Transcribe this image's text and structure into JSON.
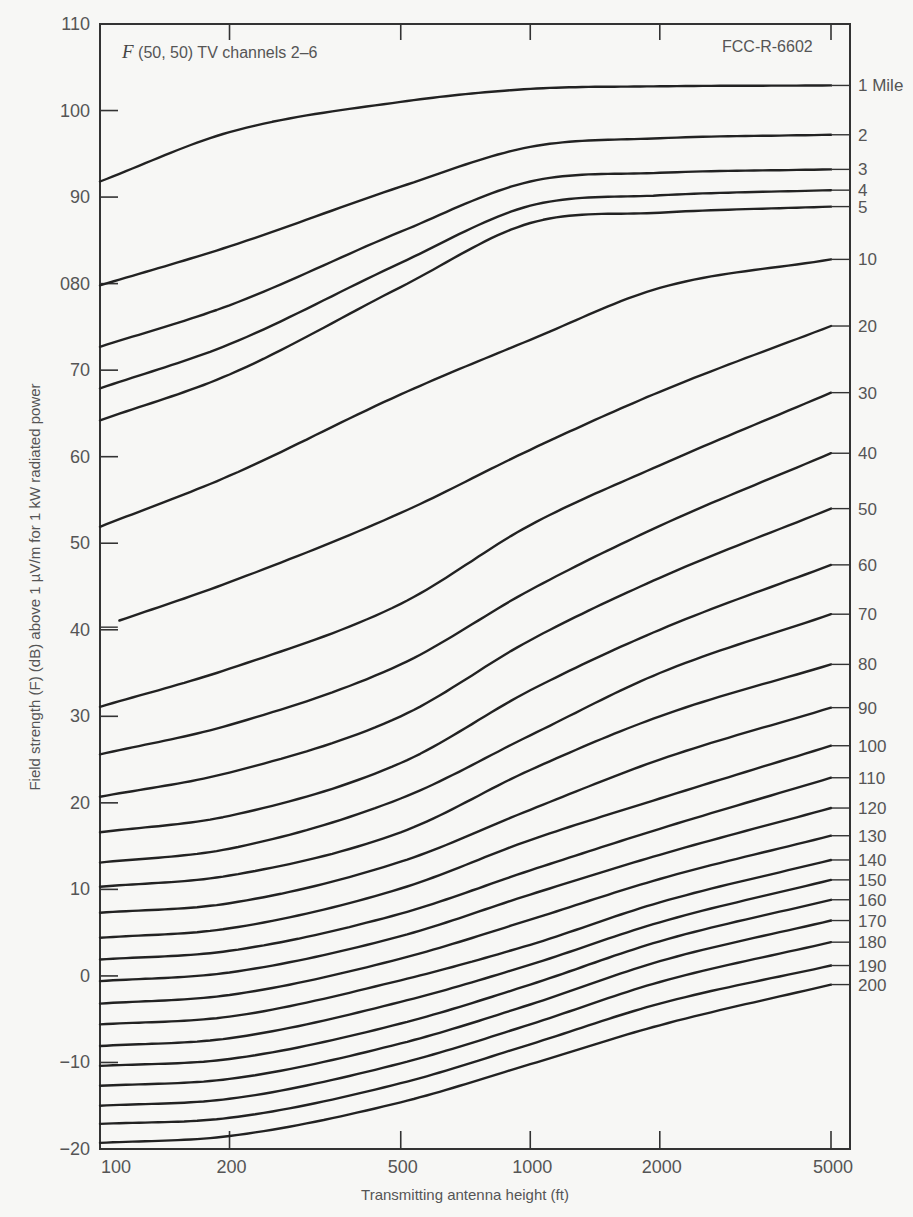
{
  "chart_data": {
    "type": "line",
    "title": "F (50, 50) TV channels 2–6",
    "title_prefix": "F",
    "title_rest": " (50, 50) TV channels 2–6",
    "reference": "FCC-R-6602",
    "xlabel": "Transmitting antenna height (ft)",
    "ylabel": "Field strength (F) (dB) above 1 µV/m for 1 kW radiated power",
    "xscale": "log",
    "xlim": [
      100,
      5000
    ],
    "ylim": [
      -20,
      110
    ],
    "grid": false,
    "x_ticks": [
      100,
      200,
      500,
      1000,
      2000,
      5000
    ],
    "x_tick_labels": [
      "100",
      "200",
      "500",
      "1000",
      "2000",
      "5000"
    ],
    "y_ticks": [
      110,
      100,
      90,
      80,
      70,
      60,
      50,
      40,
      30,
      20,
      10,
      0,
      -10,
      -20
    ],
    "y_tick_labels": [
      "110",
      "100",
      "90",
      "080",
      "70",
      "60",
      "50",
      "40",
      "30",
      "20",
      "10",
      "0",
      "−10",
      "−20"
    ],
    "series_label_position": "right",
    "x": [
      100,
      200,
      500,
      1000,
      2000,
      5000
    ],
    "series": [
      {
        "name": "1 Mile",
        "values": [
          91.8,
          97.5,
          101.0,
          102.5,
          102.8,
          102.9
        ]
      },
      {
        "name": "2",
        "values": [
          79.8,
          84.3,
          91.2,
          95.8,
          96.8,
          97.2
        ]
      },
      {
        "name": "3",
        "values": [
          72.7,
          77.5,
          86.0,
          91.8,
          92.8,
          93.2
        ]
      },
      {
        "name": "4",
        "values": [
          67.9,
          73.0,
          82.4,
          89.0,
          90.2,
          90.8
        ]
      },
      {
        "name": "5",
        "values": [
          64.2,
          69.5,
          79.6,
          87.0,
          88.2,
          88.9
        ]
      },
      {
        "name": "10",
        "values": [
          51.9,
          57.8,
          67.2,
          73.5,
          79.5,
          82.8
        ]
      },
      {
        "name": "20",
        "values": [
          40.3,
          45.5,
          53.5,
          60.8,
          67.5,
          75.1
        ]
      },
      {
        "name": "30",
        "values": [
          31.1,
          35.5,
          43.0,
          52.1,
          59.0,
          67.4
        ]
      },
      {
        "name": "40",
        "values": [
          25.6,
          29.0,
          36.0,
          44.6,
          52.0,
          60.4
        ]
      },
      {
        "name": "50",
        "values": [
          20.7,
          23.5,
          30.0,
          38.8,
          46.0,
          54.0
        ]
      },
      {
        "name": "60",
        "values": [
          16.6,
          18.5,
          24.6,
          33.0,
          40.0,
          47.5
        ]
      },
      {
        "name": "70",
        "values": [
          13.1,
          14.7,
          20.5,
          27.8,
          35.0,
          41.8
        ]
      },
      {
        "name": "80",
        "values": [
          10.3,
          11.6,
          16.6,
          23.8,
          30.0,
          36.0
        ]
      },
      {
        "name": "90",
        "values": [
          7.3,
          8.4,
          13.2,
          19.2,
          25.0,
          31.0
        ]
      },
      {
        "name": "100",
        "values": [
          4.4,
          5.5,
          10.1,
          15.7,
          20.5,
          26.6
        ]
      },
      {
        "name": "110",
        "values": [
          1.9,
          2.9,
          7.2,
          12.2,
          17.0,
          22.9
        ]
      },
      {
        "name": "120",
        "values": [
          -0.6,
          0.4,
          4.6,
          9.4,
          14.0,
          19.4
        ]
      },
      {
        "name": "130",
        "values": [
          -3.2,
          -2.2,
          2.0,
          6.5,
          11.2,
          16.2
        ]
      },
      {
        "name": "140",
        "values": [
          -5.6,
          -4.7,
          -0.5,
          3.6,
          8.5,
          13.4
        ]
      },
      {
        "name": "150",
        "values": [
          -8.1,
          -7.2,
          -3.0,
          1.3,
          6.2,
          11.1
        ]
      },
      {
        "name": "160",
        "values": [
          -10.4,
          -9.6,
          -5.5,
          -1.0,
          4.0,
          8.8
        ]
      },
      {
        "name": "170",
        "values": [
          -12.7,
          -11.9,
          -7.8,
          -3.3,
          1.7,
          6.4
        ]
      },
      {
        "name": "180",
        "values": [
          -15.0,
          -14.2,
          -10.1,
          -5.6,
          -0.7,
          3.9
        ]
      },
      {
        "name": "190",
        "values": [
          -17.1,
          -16.4,
          -12.4,
          -7.9,
          -3.2,
          1.2
        ]
      },
      {
        "name": "200",
        "values": [
          -19.3,
          -18.5,
          -14.6,
          -10.2,
          -5.7,
          -1.0
        ]
      }
    ],
    "series_start_x": {
      "20": 110
    }
  }
}
